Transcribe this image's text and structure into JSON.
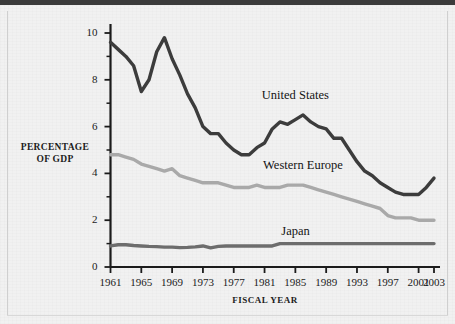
{
  "figure": {
    "background_color": "#f1f1f1",
    "top_rule_color": "#3b3b3b"
  },
  "chart_data": {
    "type": "line",
    "title": "",
    "subtitle": "",
    "xlabel": "FISCAL YEAR",
    "ylabel_line1": "PERCENTAGE",
    "ylabel_line2": "OF GDP",
    "ylabel": "PERCENTAGE OF GDP",
    "xlim": [
      1961,
      2003
    ],
    "ylim": [
      0,
      10
    ],
    "grid": false,
    "legend_position": "inline-annotations",
    "y_major_ticks": [
      0,
      2,
      4,
      6,
      8,
      10
    ],
    "y_major_tick_labels": [
      "0",
      "2",
      "4",
      "6",
      "8",
      "10"
    ],
    "y_minor_ticks": [
      1,
      3,
      5,
      7,
      9
    ],
    "x_major_ticks": [
      1961,
      1965,
      1969,
      1973,
      1977,
      1981,
      1985,
      1989,
      1993,
      1997,
      2001,
      2003
    ],
    "x_major_tick_labels": [
      "1961",
      "1965",
      "1969",
      "1973",
      "1977",
      "1981",
      "1985",
      "1989",
      "1993",
      "1997",
      "2001",
      "2003"
    ],
    "x": [
      1961,
      1962,
      1963,
      1964,
      1965,
      1966,
      1967,
      1968,
      1969,
      1970,
      1971,
      1972,
      1973,
      1974,
      1975,
      1976,
      1977,
      1978,
      1979,
      1980,
      1981,
      1982,
      1983,
      1984,
      1985,
      1986,
      1987,
      1988,
      1989,
      1990,
      1991,
      1992,
      1993,
      1994,
      1995,
      1996,
      1997,
      1998,
      1999,
      2000,
      2001,
      2002,
      2003
    ],
    "series": [
      {
        "name": "United States",
        "color": "#3c3c3c",
        "label_x": 1985,
        "label_y": 7.3,
        "values": [
          9.6,
          9.3,
          9.0,
          8.6,
          7.5,
          8.0,
          9.2,
          9.8,
          8.9,
          8.2,
          7.4,
          6.8,
          6.0,
          5.7,
          5.7,
          5.3,
          5.0,
          4.8,
          4.8,
          5.1,
          5.3,
          5.9,
          6.2,
          6.1,
          6.3,
          6.5,
          6.2,
          6.0,
          5.9,
          5.5,
          5.5,
          5.0,
          4.5,
          4.1,
          3.9,
          3.6,
          3.4,
          3.2,
          3.1,
          3.1,
          3.1,
          3.4,
          3.8
        ]
      },
      {
        "name": "Western Europe",
        "color": "#a9a9a9",
        "label_x": 1986,
        "label_y": 4.3,
        "values": [
          4.8,
          4.8,
          4.7,
          4.6,
          4.4,
          4.3,
          4.2,
          4.1,
          4.2,
          3.9,
          3.8,
          3.7,
          3.6,
          3.6,
          3.6,
          3.5,
          3.4,
          3.4,
          3.4,
          3.5,
          3.4,
          3.4,
          3.4,
          3.5,
          3.5,
          3.5,
          3.4,
          3.3,
          3.2,
          3.1,
          3.0,
          2.9,
          2.8,
          2.7,
          2.6,
          2.5,
          2.2,
          2.1,
          2.1,
          2.1,
          2.0,
          2.0,
          2.0
        ]
      },
      {
        "name": "Japan",
        "color": "#6d6d6d",
        "label_x": 1985,
        "label_y": 1.5,
        "values": [
          0.9,
          0.95,
          0.95,
          0.92,
          0.9,
          0.88,
          0.87,
          0.85,
          0.85,
          0.83,
          0.84,
          0.86,
          0.9,
          0.82,
          0.88,
          0.9,
          0.9,
          0.9,
          0.9,
          0.9,
          0.9,
          0.9,
          1.0,
          1.0,
          1.0,
          1.0,
          1.0,
          1.0,
          1.0,
          1.0,
          1.0,
          1.0,
          1.0,
          1.0,
          1.0,
          1.0,
          1.0,
          1.0,
          1.0,
          1.0,
          1.0,
          1.0,
          1.0
        ]
      }
    ]
  }
}
